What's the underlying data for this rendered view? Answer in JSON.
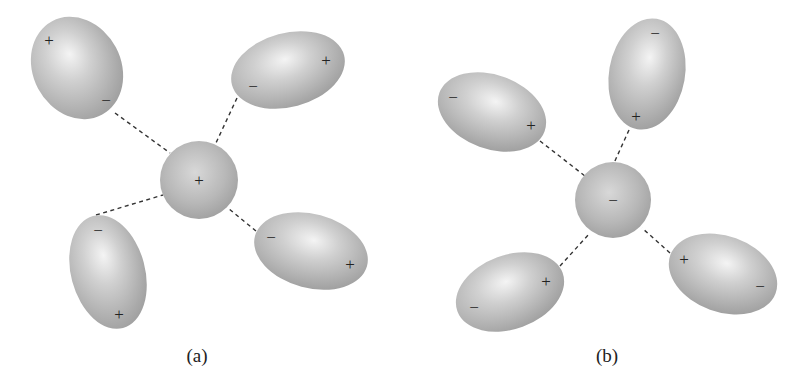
{
  "figure": {
    "colors": {
      "molecule_fill": "#b3b3b3",
      "highlight": "#f2f2f2",
      "bond_line": "#333333",
      "text": "#222222"
    }
  },
  "panels": [
    {
      "caption": "(a)",
      "center_ion": {
        "sign": "+",
        "cx": 199,
        "cy": 180,
        "r": 39
      },
      "molecules": [
        {
          "cx": 77,
          "cy": 68,
          "rx": 44,
          "ry": 53,
          "rot": -28,
          "near_sign": "−",
          "far_sign": "+",
          "near": [
            106,
            100
          ],
          "far": [
            49,
            40
          ],
          "bond_from": [
            115,
            113
          ],
          "bond_to": [
            170,
            153
          ]
        },
        {
          "cx": 288,
          "cy": 70,
          "rx": 58,
          "ry": 37,
          "rot": -15,
          "near_sign": "−",
          "far_sign": "+",
          "near": [
            253,
            86
          ],
          "far": [
            326,
            60
          ],
          "bond_from": [
            237,
            98
          ],
          "bond_to": [
            215,
            145
          ]
        },
        {
          "cx": 108,
          "cy": 272,
          "rx": 37,
          "ry": 58,
          "rot": -15,
          "near_sign": "−",
          "far_sign": "+",
          "near": [
            98,
            230
          ],
          "far": [
            119,
            314
          ],
          "bond_from": [
            96,
            215
          ],
          "bond_to": [
            163,
            195
          ]
        },
        {
          "cx": 311,
          "cy": 251,
          "rx": 58,
          "ry": 37,
          "rot": 15,
          "near_sign": "−",
          "far_sign": "+",
          "near": [
            271,
            237
          ],
          "far": [
            350,
            264
          ],
          "bond_from": [
            256,
            231
          ],
          "bond_to": [
            228,
            208
          ]
        }
      ]
    },
    {
      "caption": "(b)",
      "center_ion": {
        "sign": "−",
        "cx": 613,
        "cy": 200,
        "r": 38
      },
      "molecules": [
        {
          "cx": 492,
          "cy": 112,
          "rx": 56,
          "ry": 37,
          "rot": 20,
          "near_sign": "+",
          "far_sign": "−",
          "near": [
            531,
            125
          ],
          "far": [
            453,
            97
          ],
          "bond_from": [
            540,
            141
          ],
          "bond_to": [
            585,
            176
          ]
        },
        {
          "cx": 647,
          "cy": 74,
          "rx": 38,
          "ry": 56,
          "rot": 10,
          "near_sign": "+",
          "far_sign": "−",
          "near": [
            636,
            116
          ],
          "far": [
            655,
            33
          ],
          "bond_from": [
            629,
            130
          ],
          "bond_to": [
            614,
            163
          ]
        },
        {
          "cx": 510,
          "cy": 292,
          "rx": 56,
          "ry": 37,
          "rot": -20,
          "near_sign": "+",
          "far_sign": "−",
          "near": [
            546,
            281
          ],
          "far": [
            474,
            307
          ],
          "bond_from": [
            560,
            266
          ],
          "bond_to": [
            590,
            233
          ]
        },
        {
          "cx": 723,
          "cy": 274,
          "rx": 56,
          "ry": 38,
          "rot": 20,
          "near_sign": "+",
          "far_sign": "−",
          "near": [
            684,
            259
          ],
          "far": [
            760,
            286
          ],
          "bond_from": [
            670,
            253
          ],
          "bond_to": [
            642,
            228
          ]
        }
      ]
    }
  ],
  "captions": {
    "a": "(a)",
    "b": "(b)"
  },
  "signs": {
    "a": {
      "center": "+",
      "m0_near": "−",
      "m0_far": "+",
      "m1_near": "−",
      "m1_far": "+",
      "m2_near": "−",
      "m2_far": "+",
      "m3_near": "−",
      "m3_far": "+"
    },
    "b": {
      "center": "−",
      "m0_near": "+",
      "m0_far": "−",
      "m1_near": "+",
      "m1_far": "−",
      "m2_near": "+",
      "m2_far": "−",
      "m3_near": "+",
      "m3_far": "−"
    }
  }
}
